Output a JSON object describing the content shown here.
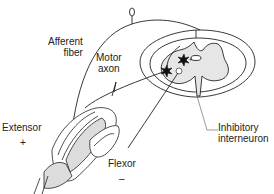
{
  "diagram": {
    "type": "reflex-arc illustration",
    "labels": {
      "afferent_fiber_line1": "Afferent",
      "afferent_fiber_line2": "fiber",
      "motor_axon_line1": "Motor",
      "motor_axon_line2": "axon",
      "inhibitory_line1": "Inhibitory",
      "inhibitory_line2": "interneuron",
      "extensor": "Extensor",
      "extensor_sign": "+",
      "flexor": "Flexor",
      "flexor_sign": "–"
    },
    "colors": {
      "stroke": "#222222",
      "grey_matter": "#e6e6e6",
      "bone": "#dcdcdc",
      "background": "#ffffff"
    }
  }
}
